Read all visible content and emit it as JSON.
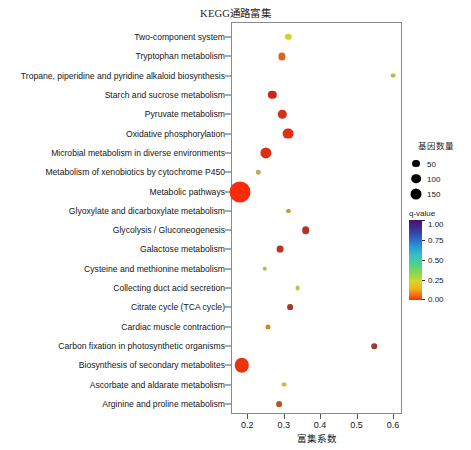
{
  "chart_data": {
    "type": "scatter",
    "title": "KEGG通路富集",
    "xlabel": "富集系数",
    "ylabel": "",
    "xlim": [
      0.155,
      0.625
    ],
    "xticks": [
      0.2,
      0.3,
      0.4,
      0.5,
      0.6
    ],
    "xticklabels": [
      "0.2",
      "0.3",
      "0.4",
      "0.5",
      "0.6"
    ],
    "grid": false,
    "legend_position": "right",
    "size_legend": {
      "title": "基因数量",
      "values": [
        50,
        100,
        150
      ],
      "labels": [
        "50",
        "100",
        "150"
      ]
    },
    "color_legend": {
      "title": "q-value",
      "ticks": [
        1.0,
        0.75,
        0.5,
        0.25,
        0.0
      ],
      "ticklabels": [
        "1.00",
        "0.75",
        "0.50",
        "0.25",
        "0.00"
      ],
      "colormap": "rainbow-reversed",
      "low_color": "#fb2a0a",
      "high_color": "#4b0f6e"
    },
    "categories": [
      "Two-component system",
      "Tryptophan metabolism",
      "Tropane, piperidine and pyridine alkaloid biosynthesis",
      "Starch and sucrose metabolism",
      "Pyruvate metabolism",
      "Oxidative phosphorylation",
      "Microbial metabolism in diverse environments",
      "Metabolism of xenobiotics by cytochrome P450",
      "Metabolic pathways",
      "Glyoxylate and dicarboxylate metabolism",
      "Glycolysis / Gluconeogenesis",
      "Galactose metabolism",
      "Cysteine and methionine metabolism",
      "Collecting duct acid secretion",
      "Citrate cycle (TCA cycle)",
      "Cardiac muscle contraction",
      "Carbon fixation in photosynthetic organisms",
      "Biosynthesis of secondary metabolites",
      "Ascorbate and aldarate metabolism",
      "Arginine and proline metabolism"
    ],
    "points": [
      {
        "label": "Two-component system",
        "x": 0.313,
        "gene_count": 10,
        "q_value": 0.22,
        "color": "#cfd42e",
        "size": 3.2
      },
      {
        "label": "Tryptophan metabolism",
        "x": 0.295,
        "gene_count": 12,
        "q_value": 0.08,
        "color": "#d9661b",
        "size": 3.6
      },
      {
        "label": "Tropane, piperidine and pyridine alkaloid biosynthesis",
        "x": 0.6,
        "gene_count": 6,
        "q_value": 0.3,
        "color": "#a8c44a",
        "size": 2.4
      },
      {
        "label": "Starch and sucrose metabolism",
        "x": 0.268,
        "gene_count": 16,
        "q_value": 0.02,
        "color": "#c9281a",
        "size": 4.2
      },
      {
        "label": "Pyruvate metabolism",
        "x": 0.296,
        "gene_count": 16,
        "q_value": 0.03,
        "color": "#cf3318",
        "size": 4.2
      },
      {
        "label": "Oxidative phosphorylation",
        "x": 0.313,
        "gene_count": 26,
        "q_value": 0.01,
        "color": "#e03213",
        "size": 5.4
      },
      {
        "label": "Microbial metabolism in diverse environments",
        "x": 0.25,
        "gene_count": 28,
        "q_value": 0.01,
        "color": "#dc2f14",
        "size": 5.6
      },
      {
        "label": "Metabolism of xenobiotics by cytochrome P450",
        "x": 0.23,
        "gene_count": 5,
        "q_value": 0.38,
        "color": "#b9b05a",
        "size": 2.2
      },
      {
        "label": "Metabolic pathways",
        "x": 0.18,
        "gene_count": 150,
        "q_value": 0.0,
        "color": "#fb2a0a",
        "size": 10.5
      },
      {
        "label": "Glyoxylate and dicarboxylate metabolism",
        "x": 0.313,
        "gene_count": 4,
        "q_value": 0.2,
        "color": "#cc9a3a",
        "size": 2.1
      },
      {
        "label": "Glycolysis / Gluconeogenesis",
        "x": 0.36,
        "gene_count": 13,
        "q_value": 0.05,
        "color": "#b3341f",
        "size": 3.8
      },
      {
        "label": "Galactose metabolism",
        "x": 0.29,
        "gene_count": 11,
        "q_value": 0.06,
        "color": "#b8351f",
        "size": 3.4
      },
      {
        "label": "Cysteine and methionine metabolism",
        "x": 0.248,
        "gene_count": 5,
        "q_value": 0.28,
        "color": "#a8bc52",
        "size": 2.3
      },
      {
        "label": "Collecting duct acid secretion",
        "x": 0.338,
        "gene_count": 5,
        "q_value": 0.25,
        "color": "#c2c043",
        "size": 2.4
      },
      {
        "label": "Citrate cycle (TCA cycle)",
        "x": 0.318,
        "gene_count": 8,
        "q_value": 0.1,
        "color": "#a33a26",
        "size": 2.9
      },
      {
        "label": "Cardiac muscle contraction",
        "x": 0.258,
        "gene_count": 6,
        "q_value": 0.18,
        "color": "#c98a2e",
        "size": 2.5
      },
      {
        "label": "Carbon fixation in photosynthetic organisms",
        "x": 0.548,
        "gene_count": 8,
        "q_value": 0.12,
        "color": "#9e3b2c",
        "size": 2.8
      },
      {
        "label": "Biosynthesis of secondary metabolites",
        "x": 0.184,
        "gene_count": 72,
        "q_value": 0.0,
        "color": "#e9350c",
        "size": 7.2
      },
      {
        "label": "Ascorbate and aldarate metabolism",
        "x": 0.3,
        "gene_count": 5,
        "q_value": 0.24,
        "color": "#c3bd41",
        "size": 2.4
      },
      {
        "label": "Arginine and proline metabolism",
        "x": 0.288,
        "gene_count": 8,
        "q_value": 0.09,
        "color": "#b8551f",
        "size": 2.9
      }
    ]
  }
}
